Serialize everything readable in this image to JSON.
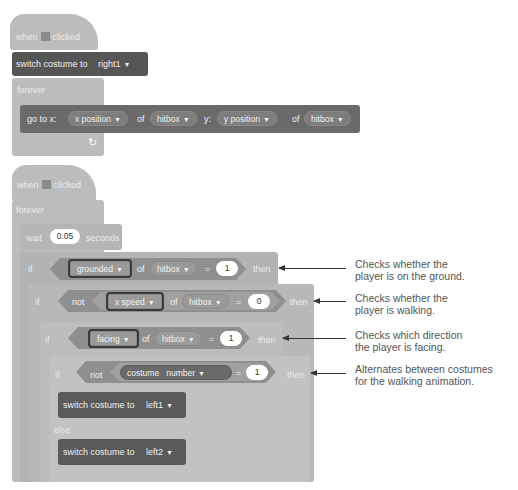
{
  "script1": {
    "hat": {
      "when": "when",
      "clicked": "clicked",
      "icon": "green-flag-icon"
    },
    "switch_costume": {
      "label": "switch costume to",
      "value": "right1"
    },
    "forever": "forever",
    "goto": {
      "label": "go to x:",
      "x_prop": "x position",
      "of1": "of",
      "x_obj": "hitbox",
      "y_label": "y:",
      "y_prop": "y position",
      "of2": "of",
      "y_obj": "hitbox"
    },
    "loop_arrow": "↻"
  },
  "script2": {
    "hat": {
      "when": "when",
      "clicked": "clicked",
      "icon": "green-flag-icon"
    },
    "forever": "forever",
    "wait": {
      "label": "wait",
      "value": "0.05",
      "unit": "seconds"
    },
    "if1": {
      "if": "if",
      "prop": "grounded",
      "of": "of",
      "obj": "hitbox",
      "eq": "=",
      "value": "1",
      "then": "then"
    },
    "if2": {
      "if": "if",
      "not": "not",
      "prop": "x speed",
      "of": "of",
      "obj": "hitbox",
      "eq": "=",
      "value": "0",
      "then": "then"
    },
    "if3": {
      "if": "if",
      "prop": "facing",
      "of": "of",
      "obj": "hitbox",
      "eq": "=",
      "value": "1",
      "then": "then"
    },
    "if4": {
      "if": "if",
      "not": "not",
      "reporter": "costume",
      "field": "number",
      "eq": "=",
      "value": "1",
      "then": "then"
    },
    "switch1": {
      "label": "switch costume to",
      "value": "left1"
    },
    "else": "else",
    "switch2": {
      "label": "switch costume to",
      "value": "left2"
    }
  },
  "annotations": [
    {
      "line1": "Checks whether the",
      "line2": "player is on the ground."
    },
    {
      "line1": "Checks whether the",
      "line2": "player is walking."
    },
    {
      "line1": "Checks which direction",
      "line2": "the player is facing."
    },
    {
      "line1": "Alternates between costumes",
      "line2": "for the walking animation."
    }
  ],
  "caret": "▼"
}
